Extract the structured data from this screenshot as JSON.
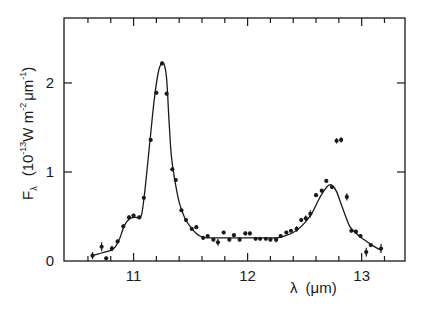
{
  "chart_data": {
    "type": "scatter",
    "title": "",
    "xlabel": "λ (μm)",
    "ylabel": "Fλ (10⁻¹³ W m⁻² μm⁻¹)",
    "ylabel_parts": {
      "main": "F",
      "sub": "λ",
      "unit_prefix": "(10",
      "unit_exp1": "-13",
      "unit_mid": "W m",
      "unit_exp2": "-2",
      "unit_mu": "μm",
      "unit_exp3": "-1",
      "unit_close": ")"
    },
    "xlabel_parts": {
      "symbol": "λ",
      "unit": "(μm)"
    },
    "xlim": [
      10.39,
      13.38
    ],
    "ylim": [
      0,
      2.73
    ],
    "x_ticks_major": [
      11,
      12,
      13
    ],
    "x_tick_labels": [
      "11",
      "12",
      "13"
    ],
    "x_ticks_minor": [
      10.6,
      10.8,
      11.2,
      11.4,
      11.6,
      11.8,
      12.2,
      12.4,
      12.6,
      12.8,
      13.2
    ],
    "y_ticks_major": [
      0,
      1,
      2
    ],
    "y_tick_labels": [
      "0",
      "1",
      "2"
    ],
    "grid": false,
    "legend": null,
    "series": [
      {
        "name": "observed",
        "kind": "points_with_errorbars",
        "x": [
          10.64,
          10.72,
          10.76,
          10.81,
          10.86,
          10.91,
          10.96,
          11.0,
          11.05,
          11.09,
          11.15,
          11.2,
          11.25,
          11.29,
          11.34,
          11.37,
          11.42,
          11.46,
          11.51,
          11.55,
          11.61,
          11.65,
          11.7,
          11.74,
          11.79,
          11.84,
          11.88,
          11.93,
          11.98,
          12.02,
          12.07,
          12.11,
          12.16,
          12.2,
          12.25,
          12.29,
          12.34,
          12.38,
          12.43,
          12.47,
          12.51,
          12.55,
          12.6,
          12.65,
          12.69,
          12.74,
          12.78,
          12.82,
          12.87,
          12.91,
          12.95,
          12.99,
          13.04,
          13.08,
          13.17
        ],
        "y": [
          0.06,
          0.16,
          0.03,
          0.14,
          0.22,
          0.39,
          0.49,
          0.51,
          0.49,
          0.71,
          1.36,
          1.89,
          2.22,
          1.88,
          1.03,
          0.91,
          0.57,
          0.46,
          0.36,
          0.38,
          0.26,
          0.28,
          0.24,
          0.21,
          0.32,
          0.24,
          0.29,
          0.24,
          0.31,
          0.31,
          0.25,
          0.25,
          0.25,
          0.24,
          0.24,
          0.28,
          0.32,
          0.34,
          0.36,
          0.46,
          0.48,
          0.53,
          0.74,
          0.79,
          0.9,
          0.83,
          1.35,
          1.36,
          0.72,
          0.34,
          0.33,
          0.28,
          0.1,
          0.18,
          0.14
        ],
        "err": [
          0.04,
          0.05,
          0.02,
          0.03,
          0.02,
          0.02,
          0.02,
          0.02,
          0.02,
          0.02,
          0.02,
          0.02,
          0.02,
          0.02,
          0.02,
          0.02,
          0.02,
          0.02,
          0.02,
          0.02,
          0.02,
          0.02,
          0.02,
          0.04,
          0.02,
          0.02,
          0.02,
          0.02,
          0.02,
          0.02,
          0.02,
          0.02,
          0.02,
          0.02,
          0.03,
          0.02,
          0.02,
          0.02,
          0.03,
          0.02,
          0.03,
          0.04,
          0.02,
          0.02,
          0.02,
          0.02,
          0.03,
          0.03,
          0.04,
          0.02,
          0.02,
          0.02,
          0.05,
          0.02,
          0.05
        ]
      },
      {
        "name": "model fit",
        "kind": "line",
        "x": [
          10.64,
          10.72,
          10.8,
          10.84,
          10.88,
          10.92,
          10.96,
          11.0,
          11.04,
          11.07,
          11.1,
          11.14,
          11.18,
          11.22,
          11.25,
          11.27,
          11.29,
          11.31,
          11.33,
          11.36,
          11.4,
          11.45,
          11.5,
          11.55,
          11.6,
          11.65,
          11.75,
          11.9,
          12.05,
          12.2,
          12.26,
          12.32,
          12.4,
          12.48,
          12.56,
          12.62,
          12.67,
          12.71,
          12.74,
          12.78,
          12.82,
          12.86,
          12.9,
          12.96,
          13.02,
          13.1,
          13.17
        ],
        "y": [
          0.06,
          0.09,
          0.12,
          0.16,
          0.26,
          0.4,
          0.47,
          0.49,
          0.49,
          0.52,
          0.8,
          1.3,
          1.8,
          2.14,
          2.22,
          2.2,
          2.05,
          1.6,
          1.2,
          0.92,
          0.66,
          0.48,
          0.38,
          0.31,
          0.27,
          0.26,
          0.26,
          0.26,
          0.26,
          0.26,
          0.26,
          0.28,
          0.32,
          0.4,
          0.53,
          0.68,
          0.79,
          0.85,
          0.85,
          0.78,
          0.64,
          0.5,
          0.38,
          0.3,
          0.24,
          0.17,
          0.12
        ]
      }
    ]
  }
}
